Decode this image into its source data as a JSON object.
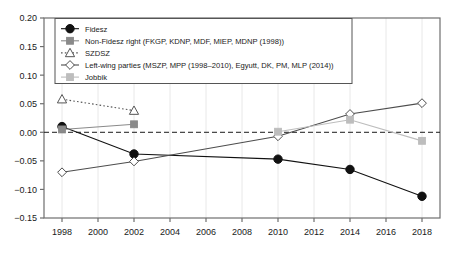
{
  "chart_data": {
    "type": "line",
    "title": "",
    "subtitle": "",
    "xlabel": "",
    "ylabel": "",
    "xlim": [
      1997,
      2019
    ],
    "ylim": [
      -0.15,
      0.2
    ],
    "grid": true,
    "grid_note": "faint vertical gridlines at each x tick",
    "legend_position": "top-left inside axes",
    "zero_reference_line": {
      "value": 0.0,
      "style": "dashed",
      "color": "#1a1a1a"
    },
    "x_ticks": [
      1998,
      2000,
      2002,
      2004,
      2006,
      2008,
      2010,
      2012,
      2014,
      2016,
      2018
    ],
    "x_tick_labels": [
      "1998",
      "2000",
      "2002",
      "2004",
      "2006",
      "2008",
      "2010",
      "2012",
      "2014",
      "2016",
      "2018"
    ],
    "y_ticks": [
      -0.15,
      -0.1,
      -0.05,
      0.0,
      0.05,
      0.1,
      0.15,
      0.2
    ],
    "y_tick_labels": [
      "−0.15",
      "−0.10",
      "−0.05",
      "0.00",
      "0.05",
      "0.10",
      "0.15",
      "0.20"
    ],
    "series": [
      {
        "name": "Fidesz",
        "marker": "filled-circle",
        "color": "#111111",
        "linestyle": "solid",
        "x": [
          1998,
          2002,
          2010,
          2014,
          2018
        ],
        "values": [
          0.01,
          -0.038,
          -0.047,
          -0.065,
          -0.112
        ]
      },
      {
        "name": "Non-Fidesz right (FKGP, KDNP, MDF, MIEP, MDNP (1998))",
        "marker": "filled-square",
        "color": "#8a8a8a",
        "linestyle": "solid",
        "x": [
          1998,
          2002
        ],
        "values": [
          0.005,
          0.014
        ]
      },
      {
        "name": "SZDSZ",
        "marker": "open-triangle",
        "color": "#555555",
        "linestyle": "dotted",
        "x": [
          1998,
          2002
        ],
        "values": [
          0.058,
          0.038
        ]
      },
      {
        "name": "Left-wing parties (MSZP, MPP (1998–2010), Egyutt, DK, PM, MLP (2014))",
        "marker": "open-diamond",
        "color": "#4d4d4d",
        "linestyle": "solid",
        "x": [
          1998,
          2002,
          2010,
          2014,
          2018
        ],
        "values": [
          -0.07,
          -0.051,
          -0.007,
          0.032,
          0.051
        ]
      },
      {
        "name": "Jobbik",
        "marker": "filled-square-light",
        "color": "#bdbdbd",
        "linestyle": "solid",
        "x": [
          2010,
          2014,
          2018
        ],
        "values": [
          0.001,
          0.022,
          -0.015
        ]
      }
    ]
  },
  "legend": {
    "entries": [
      {
        "label": "Fidesz",
        "marker": "filled-circle"
      },
      {
        "label": "Non-Fidesz right (FKGP, KDNP, MDF, MIEP, MDNP (1998))",
        "marker": "filled-square"
      },
      {
        "label": "SZDSZ",
        "marker": "open-triangle"
      },
      {
        "label": "Left-wing parties (MSZP, MPP (1998–2010), Egyutt, DK, PM, MLP (2014))",
        "marker": "open-diamond"
      },
      {
        "label": "Jobbik",
        "marker": "filled-square-light"
      }
    ]
  },
  "colors": {
    "axis": "#6e6e6e",
    "grid": "#e8e8e8",
    "text": "#1a1a1a",
    "background": "#ffffff"
  }
}
